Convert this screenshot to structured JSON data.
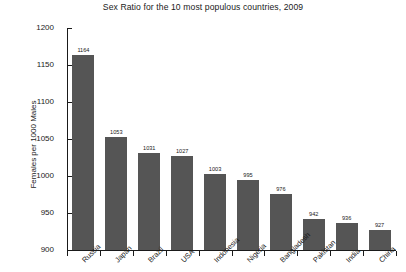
{
  "chart_data": {
    "type": "bar",
    "title": "Sex Ratio for the 10 most populous countries, 2009",
    "xlabel": "",
    "ylabel": "Females per 1000 Males",
    "ylim": [
      900,
      1200
    ],
    "ytick_labels": [
      "900",
      "950",
      "1000",
      "1050",
      "1100",
      "1150",
      "1200"
    ],
    "yticks": [
      900,
      950,
      1000,
      1050,
      1100,
      1150,
      1200
    ],
    "grid": false,
    "legend": null,
    "bar_color": "#555555",
    "categories": [
      "Russia",
      "Japan",
      "Brazil",
      "USA",
      "Indonesia",
      "Nigeria",
      "Bangladesh",
      "Pakistan",
      "India",
      "China"
    ],
    "values": [
      1164,
      1053,
      1031,
      1027,
      1003,
      995,
      976,
      942,
      936,
      927
    ],
    "value_labels": [
      "1164",
      "1053",
      "1031",
      "1027",
      "1003",
      "995",
      "976",
      "942",
      "936",
      "927"
    ]
  }
}
